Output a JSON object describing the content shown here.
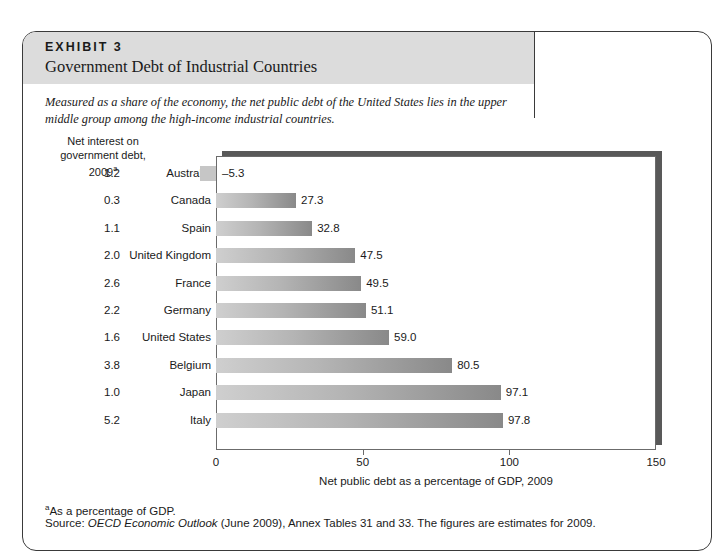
{
  "exhibit": {
    "label": "EXHIBIT 3",
    "title": "Government Debt of Industrial Countries",
    "caption": "Measured as a share of the economy, the net public debt of the United States lies in the upper middle group among the high-income industrial countries."
  },
  "interest_column": {
    "heading_line1": "Net interest on",
    "heading_line2": "government debt,",
    "heading_line3": "2009",
    "heading_superscript": "a"
  },
  "footnotes": {
    "footnote_marker": "a",
    "footnote_text": "As a percentage of GDP.",
    "source_prefix": "Source: ",
    "source_italic": "OECD Economic Outlook",
    "source_rest": " (June 2009), Annex Tables 31 and 33. The figures are estimates for 2009."
  },
  "colors": {
    "band": "#dcdcdc",
    "bar_light": "#cfcfcf",
    "bar_dark": "#898989",
    "shadow": "#595959",
    "border": "#3a3a3a"
  },
  "chart_data": {
    "type": "bar",
    "orientation": "horizontal",
    "title": "Government Debt of Industrial Countries",
    "xlabel": "Net public debt as a percentage of GDP, 2009",
    "ylabel": "",
    "xlim": [
      0,
      150
    ],
    "xticks": [
      0,
      50,
      100,
      150
    ],
    "xtick_labels": [
      "0",
      "50",
      "100",
      "150"
    ],
    "grid": false,
    "legend": false,
    "categories": [
      "Australia",
      "Canada",
      "Spain",
      "United Kingdom",
      "France",
      "Germany",
      "United States",
      "Belgium",
      "Japan",
      "Italy"
    ],
    "values": [
      -5.3,
      27.3,
      32.8,
      47.5,
      49.5,
      51.1,
      59.0,
      80.5,
      97.1,
      97.8
    ],
    "value_labels": [
      "–5.3",
      "27.3",
      "32.8",
      "47.5",
      "49.5",
      "51.1",
      "59.0",
      "80.5",
      "97.1",
      "97.8"
    ],
    "series": [
      {
        "name": "Net interest on government debt, 2009",
        "values": [
          1.2,
          0.3,
          1.1,
          2.0,
          2.6,
          2.2,
          1.6,
          3.8,
          1.0,
          5.2
        ],
        "labels": [
          "1.2",
          "0.3",
          "1.1",
          "2.0",
          "2.6",
          "2.2",
          "1.6",
          "3.8",
          "1.0",
          "5.2"
        ]
      }
    ]
  }
}
